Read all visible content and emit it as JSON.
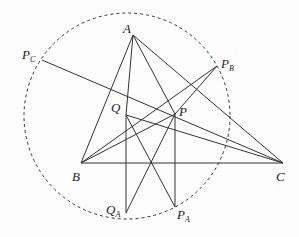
{
  "diagram": {
    "type": "geometry",
    "circle": {
      "cx": 127,
      "cy": 116,
      "r": 103,
      "style": "dashed"
    },
    "points": {
      "A": {
        "x": 133,
        "y": 35,
        "label": "A",
        "sub": "",
        "lx": 123,
        "ly": 33
      },
      "B": {
        "x": 81,
        "y": 163,
        "label": "B",
        "sub": "",
        "lx": 72,
        "ly": 181
      },
      "C": {
        "x": 283,
        "y": 163,
        "label": "C",
        "sub": "",
        "lx": 276,
        "ly": 181
      },
      "P": {
        "x": 175,
        "y": 114,
        "label": "P",
        "sub": "",
        "lx": 179,
        "ly": 116
      },
      "Q": {
        "x": 126,
        "y": 115,
        "label": "Q",
        "sub": "",
        "lx": 111,
        "ly": 112
      },
      "PA": {
        "x": 175,
        "y": 207,
        "label": "P",
        "sub": "A",
        "lx": 177,
        "ly": 219
      },
      "QA": {
        "x": 126,
        "y": 213,
        "label": "Q",
        "sub": "A",
        "lx": 106,
        "ly": 214
      },
      "PB": {
        "x": 217,
        "y": 66,
        "label": "P",
        "sub": "B",
        "lx": 221,
        "ly": 68
      },
      "PC": {
        "x": 42,
        "y": 60,
        "label": "P",
        "sub": "C",
        "lx": 22,
        "ly": 59
      }
    },
    "segments": [
      [
        "A",
        "B"
      ],
      [
        "A",
        "C"
      ],
      [
        "B",
        "C"
      ],
      [
        "A",
        "Q"
      ],
      [
        "Q",
        "QA"
      ],
      [
        "A",
        "P"
      ],
      [
        "P",
        "PA"
      ],
      [
        "PC",
        "C"
      ],
      [
        "Q",
        "C"
      ],
      [
        "Q",
        "PA"
      ],
      [
        "B",
        "P"
      ],
      [
        "B",
        "PB"
      ],
      [
        "PB",
        "P"
      ],
      [
        "P",
        "QA"
      ]
    ],
    "labels": [
      "A",
      "B",
      "C",
      "P",
      "Q",
      "P_A",
      "Q_A",
      "P_B",
      "P_C"
    ]
  }
}
